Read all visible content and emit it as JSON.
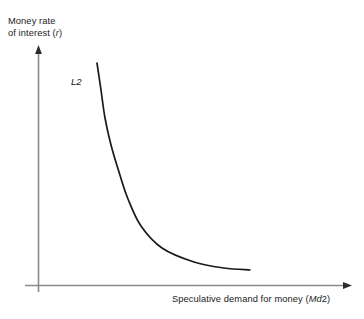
{
  "chart_data": {
    "type": "line",
    "title": "",
    "xlabel": "Speculative demand for money (Md2)",
    "ylabel": "Money rate of interest (r)",
    "grid": false,
    "legend": "none",
    "annotations": [
      {
        "name": "curve-label",
        "text": "L2",
        "text_prefix": "L",
        "text_suffix": "2",
        "x": 71,
        "y": 76
      }
    ],
    "axes": {
      "x_axis": {
        "label_main": "Speculative demand for money (",
        "label_italic": "Md",
        "label_tail": "2)",
        "arrow": true,
        "ticks": [],
        "range_note": "unlabeled"
      },
      "y_axis": {
        "label_line1": "Money rate",
        "label_line2_main": "of interest (",
        "label_line2_italic": "r",
        "label_line2_tail": ")",
        "arrow": true,
        "ticks": [],
        "range_note": "unlabeled"
      }
    },
    "series": [
      {
        "name": "L2",
        "description": "Downward sloping convex liquidity preference (speculative money demand) curve",
        "points": [
          {
            "x": 97,
            "y": 63
          },
          {
            "x": 101,
            "y": 90
          },
          {
            "x": 105,
            "y": 118
          },
          {
            "x": 111,
            "y": 145
          },
          {
            "x": 119,
            "y": 172
          },
          {
            "x": 128,
            "y": 199
          },
          {
            "x": 141,
            "y": 226
          },
          {
            "x": 162,
            "y": 248
          },
          {
            "x": 194,
            "y": 262
          },
          {
            "x": 224,
            "y": 268
          },
          {
            "x": 250,
            "y": 270
          }
        ]
      }
    ]
  },
  "colors": {
    "background": "#ffffff",
    "axis": "#8a8a8a",
    "curve": "#1a1a1a",
    "text": "#1a1a1a",
    "arrowhead": "#2b2b2b"
  },
  "labels": {
    "y_axis_line1": "Money rate",
    "y_axis_line2_prefix": "of interest (",
    "y_axis_line2_italic": "r",
    "y_axis_line2_suffix": ")",
    "x_axis_prefix": "Speculative demand for money (",
    "x_axis_italic": "Md",
    "x_axis_suffix": "2)",
    "curve_italic": "L",
    "curve_suffix": "2"
  }
}
